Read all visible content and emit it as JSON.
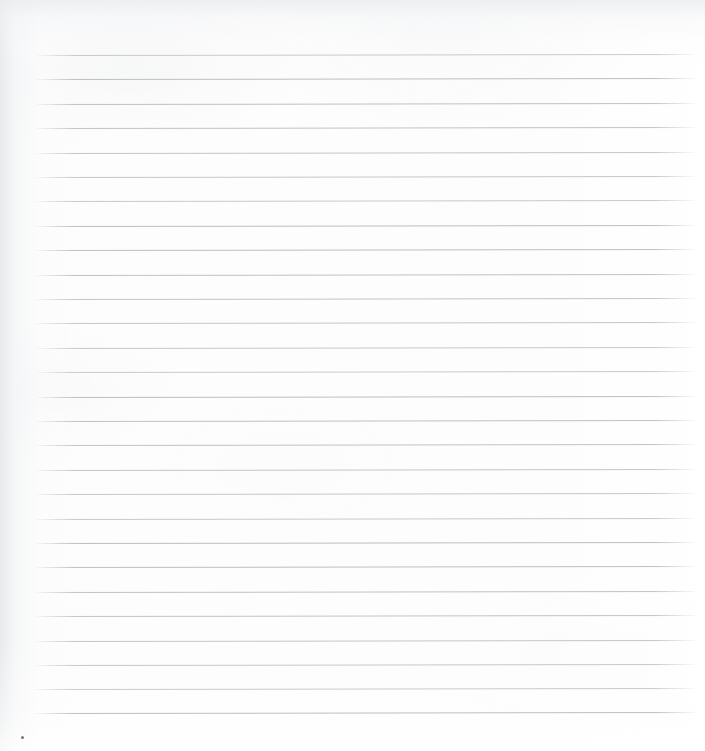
{
  "page": {
    "kind": "lined-paper-sheet",
    "width_px": 705,
    "height_px": 751,
    "background_color": "#fdfdfd",
    "text_content": "",
    "notes_visible": "none"
  },
  "ruling": {
    "line_color": "#babec2",
    "line_thickness_px": 1,
    "line_count": 28,
    "first_line_y_px": 55,
    "last_line_y_px": 713,
    "line_spacing_px": 24.37,
    "line_start_x_px": 32,
    "line_end_x_px": 697,
    "line_length_px": 665,
    "tilt_degrees": -0.09,
    "line_y_positions": [
      55,
      79,
      104,
      128,
      153,
      177,
      201,
      226,
      250,
      275,
      299,
      323,
      348,
      372,
      397,
      421,
      445,
      470,
      494,
      519,
      543,
      567,
      592,
      616,
      641,
      665,
      689,
      713
    ]
  },
  "margins": {
    "top_margin_px": 55,
    "bottom_margin_px": 38,
    "left_margin_px": 32,
    "right_margin_px": 8
  },
  "artifacts": {
    "speck": {
      "name": "dark-speck",
      "x_px": 21,
      "y_px": 736,
      "size_px": 3,
      "color": "#5a5d60"
    },
    "vignette": {
      "left_edge_tone": "#e4e6e9",
      "top_edge_tone": "#e9ebee",
      "right_edge_tone": "#ffffff",
      "center_tone": "#fdfdfd"
    }
  }
}
